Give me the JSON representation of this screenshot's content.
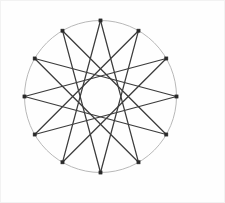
{
  "canvas": {
    "width": 225,
    "height": 203,
    "background_color": "#ffffff",
    "border_color": "#f2f2f2"
  },
  "figure": {
    "type": "star-polygon",
    "center": {
      "x": 100.5,
      "y": 96.5
    },
    "radius": 76,
    "vertex_count": 12,
    "step": 5,
    "schlafli": "{12/5}",
    "start_angle_deg": -90,
    "circle": {
      "stroke_color": "#b0b0b0",
      "stroke_width": 0.9,
      "fill": "none"
    },
    "chords": {
      "stroke_color": "#3b3b3b",
      "stroke_width": 1.25,
      "stroke_linecap": "round"
    },
    "vertices": {
      "marker_shape": "square",
      "marker_size": 3.2,
      "fill_color": "#2a2a2a",
      "stroke_color": "#2a2a2a"
    },
    "vertex_points": [
      {
        "index": 0,
        "label": "v0",
        "x": 100.5,
        "y": 20.5,
        "angle_deg": -90
      },
      {
        "index": 1,
        "label": "v1",
        "x": 138.5,
        "y": 30.7,
        "angle_deg": -60
      },
      {
        "index": 2,
        "label": "v2",
        "x": 166.3,
        "y": 58.5,
        "angle_deg": -30
      },
      {
        "index": 3,
        "label": "v3",
        "x": 176.5,
        "y": 96.5,
        "angle_deg": 0
      },
      {
        "index": 4,
        "label": "v4",
        "x": 166.3,
        "y": 134.5,
        "angle_deg": 30
      },
      {
        "index": 5,
        "label": "v5",
        "x": 138.5,
        "y": 162.3,
        "angle_deg": 60
      },
      {
        "index": 6,
        "label": "v6",
        "x": 100.5,
        "y": 172.5,
        "angle_deg": 90
      },
      {
        "index": 7,
        "label": "v7",
        "x": 62.5,
        "y": 162.3,
        "angle_deg": 120
      },
      {
        "index": 8,
        "label": "v8",
        "x": 34.7,
        "y": 134.5,
        "angle_deg": 150
      },
      {
        "index": 9,
        "label": "v9",
        "x": 24.5,
        "y": 96.5,
        "angle_deg": 180
      },
      {
        "index": 10,
        "label": "v10",
        "x": 34.7,
        "y": 58.5,
        "angle_deg": 210
      },
      {
        "index": 11,
        "label": "v11",
        "x": 62.5,
        "y": 30.7,
        "angle_deg": 240
      }
    ],
    "edges": [
      {
        "from": 0,
        "to": 5
      },
      {
        "from": 5,
        "to": 10
      },
      {
        "from": 10,
        "to": 3
      },
      {
        "from": 3,
        "to": 8
      },
      {
        "from": 8,
        "to": 1
      },
      {
        "from": 1,
        "to": 6
      },
      {
        "from": 6,
        "to": 11
      },
      {
        "from": 11,
        "to": 4
      },
      {
        "from": 4,
        "to": 9
      },
      {
        "from": 9,
        "to": 2
      },
      {
        "from": 2,
        "to": 7
      },
      {
        "from": 7,
        "to": 0
      }
    ]
  }
}
